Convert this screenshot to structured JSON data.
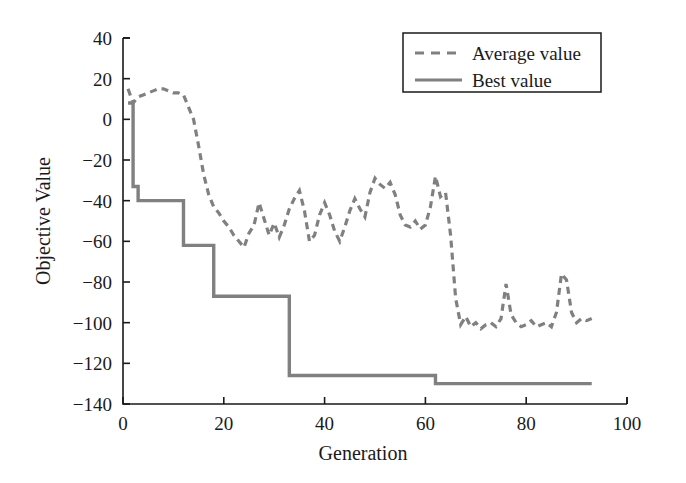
{
  "chart_data": {
    "type": "line",
    "title": "",
    "xlabel": "Generation",
    "ylabel": "Objective Value",
    "xlim": [
      0,
      100
    ],
    "ylim": [
      -140,
      40
    ],
    "xticks": [
      0,
      20,
      40,
      60,
      80,
      100
    ],
    "yticks": [
      40,
      20,
      0,
      -20,
      -40,
      -60,
      -80,
      -100,
      -120,
      -140
    ],
    "xtick_labels": [
      "0",
      "20",
      "40",
      "60",
      "80",
      "100"
    ],
    "ytick_labels": [
      "40",
      "20",
      "0",
      "−20",
      "−40",
      "−60",
      "−80",
      "−100",
      "−120",
      "−140"
    ],
    "grid": false,
    "legend_position": "top-right",
    "line_color": "#808080",
    "series": [
      {
        "name": "Average value",
        "style": "dashed",
        "color": "#808080",
        "x": [
          1,
          2,
          3,
          4,
          5,
          6,
          7,
          8,
          9,
          10,
          11,
          12,
          13,
          14,
          15,
          16,
          17,
          18,
          19,
          20,
          21,
          22,
          23,
          24,
          25,
          26,
          27,
          28,
          29,
          30,
          31,
          32,
          33,
          34,
          35,
          36,
          37,
          38,
          39,
          40,
          41,
          42,
          43,
          44,
          45,
          46,
          47,
          48,
          49,
          50,
          51,
          52,
          53,
          54,
          55,
          56,
          57,
          58,
          59,
          60,
          61,
          62,
          63,
          64,
          65,
          66,
          67,
          68,
          69,
          70,
          71,
          72,
          73,
          74,
          75,
          76,
          77,
          78,
          79,
          80,
          81,
          82,
          83,
          84,
          85,
          86,
          87,
          88,
          89,
          90,
          91,
          92,
          93
        ],
        "values": [
          15,
          8,
          11,
          12,
          13,
          14,
          15,
          15,
          14,
          13,
          13,
          12,
          6,
          0,
          -13,
          -27,
          -37,
          -43,
          -46,
          -50,
          -53,
          -57,
          -60,
          -63,
          -56,
          -52,
          -41,
          -49,
          -57,
          -51,
          -58,
          -52,
          -44,
          -39,
          -35,
          -45,
          -60,
          -57,
          -47,
          -41,
          -47,
          -55,
          -60,
          -53,
          -45,
          -39,
          -44,
          -48,
          -36,
          -29,
          -32,
          -34,
          -31,
          -37,
          -47,
          -52,
          -53,
          -50,
          -54,
          -52,
          -43,
          -28,
          -38,
          -36,
          -57,
          -88,
          -101,
          -97,
          -102,
          -100,
          -103,
          -101,
          -100,
          -102,
          -98,
          -81,
          -96,
          -100,
          -102,
          -101,
          -99,
          -102,
          -101,
          -100,
          -102,
          -95,
          -76,
          -79,
          -95,
          -100,
          -98,
          -99,
          -98
        ]
      },
      {
        "name": "Best value",
        "style": "solid",
        "color": "#808080",
        "step": true,
        "x": [
          1,
          2,
          3,
          12,
          18,
          33,
          62,
          93
        ],
        "values": [
          8,
          -33,
          -40,
          -62,
          -87,
          -126,
          -130,
          -130
        ],
        "step_segments": [
          {
            "x_start": 1,
            "x_end": 2,
            "value": 8
          },
          {
            "x_start": 2,
            "x_end": 3,
            "value": -33
          },
          {
            "x_start": 3,
            "x_end": 12,
            "value": -40
          },
          {
            "x_start": 12,
            "x_end": 18,
            "value": -62
          },
          {
            "x_start": 18,
            "x_end": 33,
            "value": -87
          },
          {
            "x_start": 33,
            "x_end": 62,
            "value": -126
          },
          {
            "x_start": 62,
            "x_end": 93,
            "value": -130
          }
        ]
      }
    ]
  },
  "legend": {
    "items": [
      {
        "label": "Average value",
        "style": "dashed"
      },
      {
        "label": "Best value",
        "style": "solid"
      }
    ]
  },
  "axes": {
    "x_title": "Generation",
    "y_title": "Objective Value"
  }
}
